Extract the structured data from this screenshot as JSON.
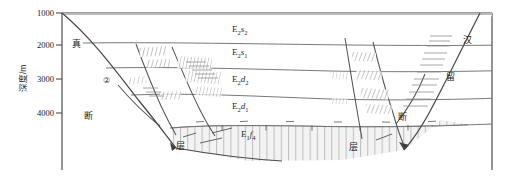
{
  "figure": {
    "type": "geological-cross-section",
    "width": 506,
    "height": 187,
    "background": "#ffffff",
    "line_color": "#5a5a5a",
    "fault_color": "#444444",
    "hatch_color": "#9a9a9a",
    "shade_color": "#b0b0b0"
  },
  "axis": {
    "title": "深度/m",
    "ticks": [
      {
        "label": "1000",
        "value": 1000,
        "y": 13
      },
      {
        "label": "2000",
        "value": 2000,
        "y": 45
      },
      {
        "label": "3000",
        "value": 3000,
        "y": 79
      },
      {
        "label": "4000",
        "value": 4000,
        "y": 113
      }
    ],
    "range": [
      1000,
      4600
    ]
  },
  "strat_units": [
    {
      "id": "e2s2",
      "main": "E",
      "msub": "2",
      "ital": "s",
      "isub": "2",
      "x": 232,
      "y": 28
    },
    {
      "id": "e2s1",
      "main": "E",
      "msub": "2",
      "ital": "s",
      "isub": "1",
      "x": 232,
      "y": 51
    },
    {
      "id": "e2d2",
      "main": "E",
      "msub": "2",
      "ital": "d",
      "isub": "2",
      "x": 232,
      "y": 78
    },
    {
      "id": "e2d1",
      "main": "E",
      "msub": "2",
      "ital": "d",
      "isub": "1",
      "x": 232,
      "y": 105
    },
    {
      "id": "e1f4",
      "main": "E",
      "msub": "1",
      "ital": "f",
      "isub": "4",
      "x": 241,
      "y": 133
    }
  ],
  "annotations": [
    {
      "id": "zhen",
      "text": "真",
      "x": 72,
      "y": 45
    },
    {
      "id": "duan-left",
      "text": "断",
      "x": 84,
      "y": 117
    },
    {
      "id": "ceng-left",
      "text": "层",
      "x": 176,
      "y": 147
    },
    {
      "id": "duan-right",
      "text": "断",
      "x": 398,
      "y": 118
    },
    {
      "id": "ceng-right",
      "text": "层",
      "x": 349,
      "y": 148
    },
    {
      "id": "han",
      "text": "汉",
      "x": 463,
      "y": 41
    },
    {
      "id": "liu",
      "text": "留",
      "x": 446,
      "y": 78
    }
  ],
  "markers": [
    {
      "id": "marker-2",
      "text": "②",
      "x": 103,
      "y": 80
    }
  ]
}
